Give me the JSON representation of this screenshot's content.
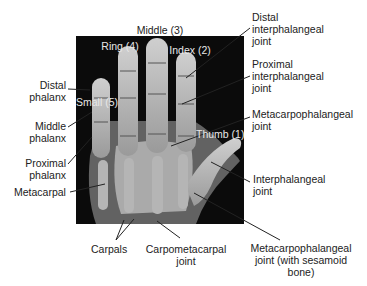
{
  "figure": {
    "finger_labels": {
      "middle": "Middle (3)",
      "ring": "Ring (4)",
      "index": "Index (2)",
      "small": "Small (5)",
      "thumb": "Thumb (1)"
    },
    "left_labels": {
      "distal_phalanx": "Distal\nphalanx",
      "middle_phalanx": "Middle\nphalanx",
      "proximal_phalanx": "Proximal\nphalanx",
      "metacarpal": "Metacarpal"
    },
    "right_labels": {
      "dip_joint": "Distal\ninterphalangeal\njoint",
      "pip_joint": "Proximal\ninterphalangeal\njoint",
      "mcp_joint": "Metacarpophalangeal\njoint",
      "ip_joint": "Interphalangeal\njoint",
      "thumb_mcp_joint": "Metacarpophalangeal\njoint (with sesamoid\nbone)"
    },
    "bottom_labels": {
      "carpals": "Carpals",
      "cmc_joint": "Carpometacarpal\njoint"
    },
    "colors": {
      "background": "#ffffff",
      "xray_bg": "#0b0b0b",
      "bone": "#d9d9d9",
      "leader_line": "#222222",
      "text": "#222222",
      "on_image_text": "#e8e8e8"
    }
  }
}
